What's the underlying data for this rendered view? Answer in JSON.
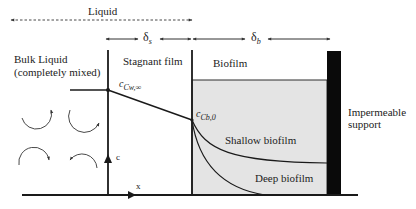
{
  "diagram": {
    "type": "biofilm-concentration-profile",
    "labels": {
      "liquid": "Liquid",
      "delta_s": "δ",
      "delta_s_sub": "s",
      "delta_b": "δ",
      "delta_b_sub": "b",
      "bulk_liquid_line1": "Bulk Liquid",
      "bulk_liquid_line2": "(completely mixed)",
      "stagnant_film": "Stagnant film",
      "biofilm": "Biofilm",
      "impermeable_line1": "Impermeable",
      "impermeable_line2": "support",
      "c_cw_inf": "c",
      "c_cw_inf_sub": "Cw,∞",
      "c_cb0": "c",
      "c_cb0_sub": "Cb,0",
      "shallow_biofilm": "Shallow biofilm",
      "deep_biofilm": "Deep biofilm",
      "axis_c": "c",
      "axis_x": "x"
    },
    "colors": {
      "line": "#1a1a1a",
      "biofilm_fill": "#e4e4e4",
      "support": "#0a0a0a"
    },
    "regions": [
      "Bulk Liquid",
      "Stagnant film",
      "Biofilm",
      "Impermeable support"
    ],
    "curves": [
      "Shallow biofilm",
      "Deep biofilm"
    ]
  }
}
